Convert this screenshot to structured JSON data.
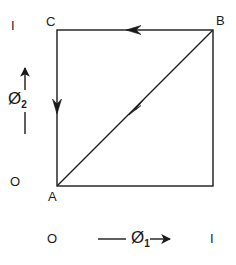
{
  "figure": {
    "type": "unit-square-phase-diagram",
    "background_color": "#ffffff",
    "stroke_color": "#1a1a1a"
  },
  "axes": {
    "x": {
      "symbol": "Ø",
      "subscript": "1",
      "min_label": "O",
      "max_label": "I",
      "direction": "right"
    },
    "y": {
      "symbol": "Ø",
      "subscript": "2",
      "min_label": "O",
      "max_label": "I",
      "direction": "up"
    }
  },
  "vertices": {
    "a": "A",
    "b": "B",
    "c": "C"
  },
  "square": {
    "left": 57,
    "top": 30,
    "right": 213,
    "bottom": 186
  },
  "paths": [
    {
      "name": "top-edge",
      "from": "B",
      "to": "C",
      "arrow": "left"
    },
    {
      "name": "left-edge",
      "from": "C",
      "to": "A",
      "arrow": "down"
    },
    {
      "name": "diagonal",
      "from": "A",
      "to": "B",
      "arrow": "up-right"
    },
    {
      "name": "bottom-edge",
      "from": "A",
      "to": "bottom-right",
      "arrow": "none"
    },
    {
      "name": "right-edge",
      "from": "bottom-right",
      "to": "B",
      "arrow": "none"
    }
  ]
}
